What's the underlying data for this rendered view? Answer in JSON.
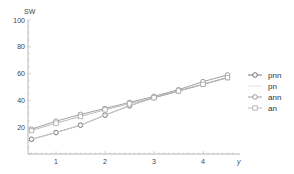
{
  "chart_data": {
    "type": "line",
    "title": "",
    "xlabel": "y",
    "ylabel": "SW",
    "xlim": [
      0,
      4.7
    ],
    "ylim": [
      0,
      100
    ],
    "x_ticks": [
      "1",
      "2",
      "3",
      "4"
    ],
    "y_ticks": [
      "20",
      "40",
      "60",
      "80",
      "100"
    ],
    "grid": false,
    "legend_position": "right",
    "x": [
      0.5,
      1.0,
      1.5,
      2.0,
      2.5,
      3.0,
      3.5,
      4.0,
      4.5
    ],
    "series": [
      {
        "name": "pnn",
        "color": "#555555",
        "marker": "circle",
        "values": [
          11,
          16,
          21.5,
          29,
          36,
          42,
          47,
          52,
          57
        ]
      },
      {
        "name": "pn",
        "color": "#dddddd",
        "marker": "none",
        "values": [
          11,
          16,
          21.5,
          29,
          36,
          42,
          47,
          52,
          57
        ]
      },
      {
        "name": "ann",
        "color": "#888888",
        "marker": "circle",
        "values": [
          18.5,
          24.5,
          29.5,
          34,
          38.5,
          43,
          48,
          54,
          59
        ]
      },
      {
        "name": "an",
        "color": "#aaaaaa",
        "marker": "square",
        "values": [
          17.5,
          23,
          28,
          33,
          37.5,
          42,
          47,
          52,
          57
        ]
      }
    ]
  },
  "axes": {
    "x_title": "y",
    "y_title": "SW"
  },
  "legend": [
    {
      "label": "pnn"
    },
    {
      "label": "pn"
    },
    {
      "label": "ann"
    },
    {
      "label": "an"
    }
  ]
}
